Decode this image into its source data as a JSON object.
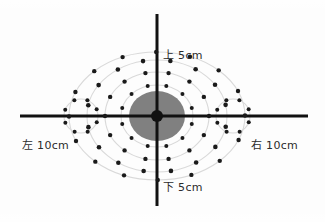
{
  "figure": {
    "title_visible": false,
    "background_color": "#fdfdfd",
    "axis_color": "#111111",
    "dot_color": "#1a1a1a",
    "core_color": "#808080",
    "ring_line_color": "#d9d9d9",
    "labels": {
      "up": "上 5cm",
      "down": "下 5cm",
      "left": "左 10cm",
      "right": "右 10cm"
    },
    "center": {
      "x": 157,
      "y": 116
    },
    "axes": {
      "vertical": {
        "x": 157,
        "y_top": 14,
        "y_bottom": 206,
        "width": 3
      },
      "horizontal": {
        "y": 116,
        "x_left": 20,
        "x_right": 308,
        "width": 3
      }
    },
    "core_ellipse": {
      "cx": 157,
      "cy": 116,
      "rx": 28,
      "ry": 25
    },
    "center_dot": {
      "cx": 157,
      "cy": 116,
      "r": 6
    },
    "rings": [
      {
        "name": "ring-1",
        "rx": 36,
        "ry": 31,
        "dots": 12,
        "dot_r": 2.0,
        "phase": 15
      },
      {
        "name": "ring-2",
        "rx": 52,
        "ry": 44,
        "dots": 14,
        "dot_r": 2.2,
        "phase": 0
      },
      {
        "name": "ring-3",
        "rx": 70,
        "ry": 56,
        "dots": 16,
        "dot_r": 2.3,
        "phase": 11
      },
      {
        "name": "ring-4",
        "rx": 88,
        "ry": 64,
        "dots": 16,
        "dot_r": 2.2,
        "phase": 22
      }
    ],
    "side_circles": [
      {
        "name": "left-satellite",
        "cx": 81,
        "cy": 116,
        "r": 17,
        "dots": 8,
        "dot_r": 2.0,
        "phase": 22
      },
      {
        "name": "right-satellite",
        "cx": 233,
        "cy": 116,
        "r": 17,
        "dots": 8,
        "dot_r": 2.0,
        "phase": 22
      }
    ]
  },
  "chart_data": {
    "type": "scatter",
    "title": "",
    "xlabel": "",
    "ylabel": "",
    "description_axes": {
      "up": "上 5cm",
      "down": "下 5cm",
      "left": "左 10cm",
      "right": "右 10cm"
    },
    "legend": [],
    "grid": false,
    "xlim": [
      -10,
      10
    ],
    "ylim": [
      -5,
      5
    ],
    "series": [
      {
        "name": "ring-1",
        "radius_x_cm": 1.9,
        "radius_y_cm": 1.6,
        "n_points": 12,
        "values": [
          1.9,
          1.9,
          1.9,
          1.9,
          1.9,
          1.9,
          1.9,
          1.9,
          1.9,
          1.9,
          1.9,
          1.9
        ]
      },
      {
        "name": "ring-2",
        "radius_x_cm": 2.8,
        "radius_y_cm": 2.3,
        "n_points": 14,
        "values": [
          2.8,
          2.8,
          2.8,
          2.8,
          2.8,
          2.8,
          2.8,
          2.8,
          2.8,
          2.8,
          2.8,
          2.8,
          2.8,
          2.8
        ]
      },
      {
        "name": "ring-3",
        "radius_x_cm": 3.7,
        "radius_y_cm": 2.9,
        "n_points": 16,
        "values": [
          3.7,
          3.7,
          3.7,
          3.7,
          3.7,
          3.7,
          3.7,
          3.7,
          3.7,
          3.7,
          3.7,
          3.7,
          3.7,
          3.7,
          3.7,
          3.7
        ]
      },
      {
        "name": "ring-4",
        "radius_x_cm": 4.7,
        "radius_y_cm": 3.4,
        "n_points": 16,
        "values": [
          4.7,
          4.7,
          4.7,
          4.7,
          4.7,
          4.7,
          4.7,
          4.7,
          4.7,
          4.7,
          4.7,
          4.7,
          4.7,
          4.7,
          4.7,
          4.7
        ]
      },
      {
        "name": "left-satellite",
        "center_cm": [
          -4.0,
          0
        ],
        "radius_cm": 0.9,
        "n_points": 8,
        "values": [
          0.9,
          0.9,
          0.9,
          0.9,
          0.9,
          0.9,
          0.9,
          0.9
        ]
      },
      {
        "name": "right-satellite",
        "center_cm": [
          4.0,
          0
        ],
        "radius_cm": 0.9,
        "n_points": 8,
        "values": [
          0.9,
          0.9,
          0.9,
          0.9,
          0.9,
          0.9,
          0.9,
          0.9
        ]
      }
    ]
  }
}
